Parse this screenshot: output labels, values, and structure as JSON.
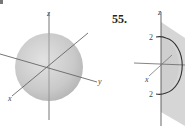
{
  "figures": [
    {
      "id": "sphere-figure",
      "problem_number": "",
      "axes": {
        "z_label": "z",
        "y_label": "y",
        "x_label": "x"
      },
      "shape": "sphere",
      "colors": {
        "fill": "#c8c8c8",
        "axis": "#555555"
      }
    },
    {
      "id": "half-disk-figure",
      "problem_number": "55.",
      "axes": {
        "z_label": "z",
        "x_label": "x"
      },
      "shape": "semicircle in plane",
      "tick_labels": {
        "top": "2",
        "bottom": "2"
      },
      "colors": {
        "plane": "#dadada",
        "curve": "#333333",
        "axis": "#555555"
      }
    }
  ]
}
